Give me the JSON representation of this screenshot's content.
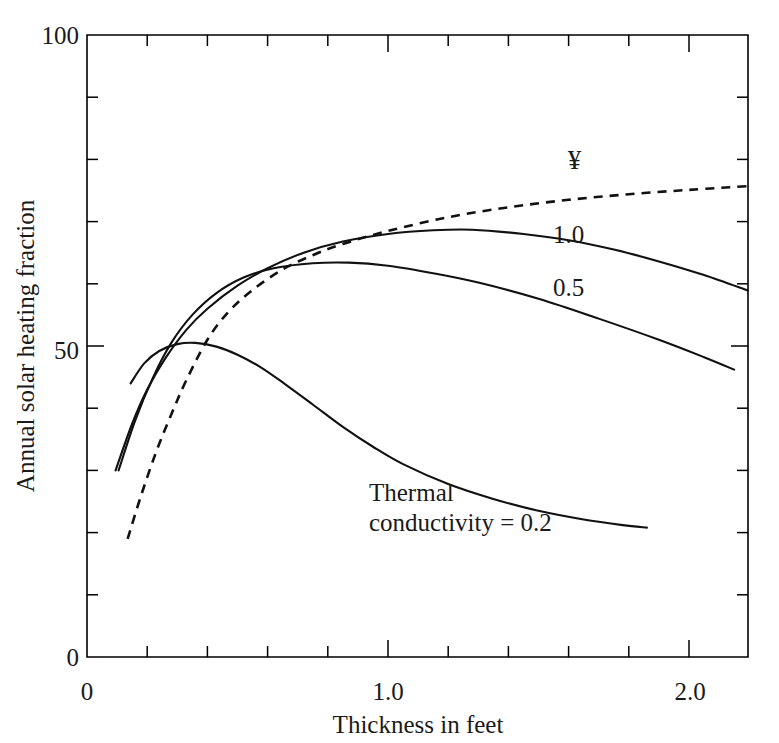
{
  "figure": {
    "background_color": "#ffffff",
    "line_color": "#111111",
    "axis_color": "#000000"
  },
  "chart_data": {
    "type": "line",
    "title": "",
    "xlabel": "Thickness in feet",
    "ylabel": "Annual solar heating fraction",
    "xlim": [
      0,
      2.196
    ],
    "ylim": [
      0,
      100
    ],
    "grid": false,
    "legend_position": "inline-curve-labels",
    "x_ticks_major": [
      0,
      1.0,
      2.0
    ],
    "x_tick_labels": [
      "0",
      "1.0",
      "2.0"
    ],
    "x_ticks_minor": [
      0.2,
      0.4,
      0.6,
      0.8,
      1.2,
      1.4,
      1.6,
      1.8,
      2.2
    ],
    "y_ticks_major": [
      0,
      50,
      100
    ],
    "y_tick_labels": [
      "0",
      "50",
      "100"
    ],
    "y_ticks_minor": [
      10,
      20,
      30,
      40,
      60,
      70,
      80,
      90
    ],
    "series": [
      {
        "name": "infinity",
        "label": "¥",
        "style": "dashed",
        "label_x": 1.62,
        "label_y": 78.5,
        "points": [
          [
            0.135,
            19.0
          ],
          [
            0.18,
            26.0
          ],
          [
            0.23,
            33.0
          ],
          [
            0.28,
            39.0
          ],
          [
            0.33,
            44.5
          ],
          [
            0.4,
            51.0
          ],
          [
            0.47,
            55.5
          ],
          [
            0.55,
            59.0
          ],
          [
            0.65,
            62.3
          ],
          [
            0.75,
            64.6
          ],
          [
            0.85,
            66.4
          ],
          [
            1.0,
            68.5
          ],
          [
            1.2,
            70.7
          ],
          [
            1.4,
            72.3
          ],
          [
            1.6,
            73.5
          ],
          [
            1.8,
            74.4
          ],
          [
            2.0,
            75.1
          ],
          [
            2.196,
            75.7
          ]
        ]
      },
      {
        "name": "k-1.0",
        "label": "1.0",
        "style": "solid",
        "label_x": 1.6,
        "label_y": 66.5,
        "points": [
          [
            0.095,
            30.0
          ],
          [
            0.15,
            37.5
          ],
          [
            0.2,
            43.0
          ],
          [
            0.26,
            48.0
          ],
          [
            0.33,
            52.6
          ],
          [
            0.4,
            56.0
          ],
          [
            0.5,
            59.7
          ],
          [
            0.6,
            62.5
          ],
          [
            0.72,
            65.0
          ],
          [
            0.85,
            66.8
          ],
          [
            1.0,
            68.0
          ],
          [
            1.15,
            68.6
          ],
          [
            1.28,
            68.7
          ],
          [
            1.45,
            68.0
          ],
          [
            1.6,
            67.0
          ],
          [
            1.75,
            65.5
          ],
          [
            1.9,
            63.6
          ],
          [
            2.05,
            61.4
          ],
          [
            2.196,
            58.9
          ]
        ]
      },
      {
        "name": "k-0.5",
        "label": "0.5",
        "style": "solid",
        "label_x": 1.6,
        "label_y": 58.0,
        "points": [
          [
            0.105,
            30.0
          ],
          [
            0.16,
            38.0
          ],
          [
            0.22,
            45.0
          ],
          [
            0.28,
            50.5
          ],
          [
            0.35,
            55.0
          ],
          [
            0.43,
            58.5
          ],
          [
            0.52,
            61.0
          ],
          [
            0.62,
            62.5
          ],
          [
            0.75,
            63.3
          ],
          [
            0.87,
            63.4
          ],
          [
            1.0,
            62.9
          ],
          [
            1.15,
            61.7
          ],
          [
            1.3,
            60.2
          ],
          [
            1.5,
            57.6
          ],
          [
            1.7,
            54.4
          ],
          [
            1.9,
            51.0
          ],
          [
            2.05,
            48.2
          ],
          [
            2.15,
            46.2
          ]
        ]
      },
      {
        "name": "k-0.2",
        "label": "Thermal conductivity = 0.2",
        "style": "solid",
        "label_x": 0.88,
        "label_y": 23.5,
        "points": [
          [
            0.145,
            44.0
          ],
          [
            0.19,
            47.2
          ],
          [
            0.24,
            49.2
          ],
          [
            0.3,
            50.3
          ],
          [
            0.36,
            50.5
          ],
          [
            0.43,
            49.9
          ],
          [
            0.5,
            48.6
          ],
          [
            0.58,
            46.5
          ],
          [
            0.66,
            43.8
          ],
          [
            0.75,
            40.6
          ],
          [
            0.85,
            37.0
          ],
          [
            0.95,
            33.8
          ],
          [
            1.05,
            31.0
          ],
          [
            1.2,
            27.8
          ],
          [
            1.35,
            25.4
          ],
          [
            1.5,
            23.5
          ],
          [
            1.65,
            22.1
          ],
          [
            1.78,
            21.2
          ],
          [
            1.86,
            20.8
          ]
        ]
      }
    ]
  },
  "annotations": {
    "thermal_line1": "Thermal",
    "thermal_line2": "conductivity = 0.2",
    "infinity_symbol": "¥",
    "label_1_0": "1.0",
    "label_0_5": "0.5"
  }
}
